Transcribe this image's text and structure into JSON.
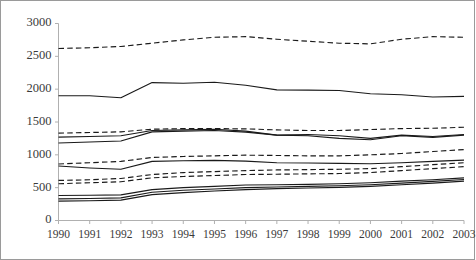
{
  "chart_data": {
    "type": "line",
    "title": "",
    "subtitle": "",
    "xlabel": "",
    "ylabel": "",
    "categories": [
      1990,
      1991,
      1992,
      1993,
      1994,
      1995,
      1996,
      1997,
      1998,
      1999,
      2000,
      2001,
      2002,
      2003
    ],
    "x": [
      "1990",
      "1991",
      "1992",
      "1993",
      "1994",
      "1995",
      "1996",
      "1997",
      "1998",
      "1999",
      "2000",
      "2001",
      "2002",
      "2003"
    ],
    "ylim": [
      0,
      3000
    ],
    "xlim": [
      1990,
      2003
    ],
    "yticks": [
      0,
      500,
      1000,
      1500,
      2000,
      2500,
      3000
    ],
    "ytick_labels": [
      "0",
      "500",
      "1000",
      "1500",
      "2000",
      "2500",
      "3000"
    ],
    "xtick_labels": [
      "1990",
      "1991",
      "1992",
      "1993",
      "1994",
      "1995",
      "1996",
      "1997",
      "1998",
      "1999",
      "2000",
      "2001",
      "2002",
      "2003"
    ],
    "grid": false,
    "legend": "none",
    "legend_visible": false,
    "line_color": "#1a1a1a",
    "series": [
      {
        "name": "series-1",
        "style": "dashed",
        "band": "top",
        "values": [
          2620,
          2630,
          2650,
          2700,
          2750,
          2790,
          2800,
          2760,
          2730,
          2700,
          2690,
          2760,
          2800,
          2790
        ]
      },
      {
        "name": "series-2",
        "style": "solid",
        "band": "upper-mid",
        "values": [
          1900,
          1900,
          1870,
          2100,
          2090,
          2105,
          2060,
          1990,
          1985,
          1980,
          1930,
          1915,
          1880,
          1890
        ]
      },
      {
        "name": "series-3",
        "style": "dashed",
        "band": "mid",
        "values": [
          1330,
          1340,
          1350,
          1390,
          1400,
          1400,
          1395,
          1380,
          1370,
          1370,
          1385,
          1400,
          1405,
          1420
        ]
      },
      {
        "name": "series-4",
        "style": "solid",
        "band": "mid",
        "values": [
          1270,
          1280,
          1290,
          1370,
          1380,
          1390,
          1360,
          1300,
          1310,
          1290,
          1250,
          1300,
          1280,
          1310
        ]
      },
      {
        "name": "series-5",
        "style": "solid",
        "band": "mid",
        "values": [
          1180,
          1195,
          1210,
          1350,
          1360,
          1370,
          1345,
          1300,
          1290,
          1250,
          1230,
          1290,
          1265,
          1300
        ]
      },
      {
        "name": "series-6",
        "style": "dashed",
        "band": "lower-mid",
        "values": [
          860,
          880,
          900,
          960,
          975,
          985,
          995,
          990,
          985,
          985,
          1000,
          1020,
          1050,
          1080
        ]
      },
      {
        "name": "series-7",
        "style": "solid",
        "band": "lower-mid",
        "values": [
          830,
          800,
          780,
          900,
          910,
          915,
          905,
          880,
          875,
          870,
          865,
          880,
          900,
          920
        ]
      },
      {
        "name": "series-8",
        "style": "dashed",
        "band": "lower-mid",
        "values": [
          610,
          620,
          640,
          700,
          730,
          745,
          760,
          770,
          775,
          780,
          790,
          820,
          850,
          880
        ]
      },
      {
        "name": "series-9",
        "style": "dashed",
        "band": "lower-mid",
        "values": [
          560,
          575,
          590,
          650,
          670,
          685,
          700,
          705,
          710,
          715,
          730,
          760,
          790,
          820
        ]
      },
      {
        "name": "series-10",
        "style": "solid",
        "band": "bottom",
        "values": [
          380,
          385,
          390,
          470,
          500,
          520,
          540,
          545,
          550,
          560,
          575,
          600,
          620,
          650
        ]
      },
      {
        "name": "series-11",
        "style": "solid",
        "band": "bottom",
        "values": [
          330,
          335,
          345,
          430,
          460,
          480,
          500,
          510,
          520,
          530,
          545,
          570,
          595,
          625
        ]
      },
      {
        "name": "series-12",
        "style": "solid",
        "band": "bottom",
        "values": [
          295,
          300,
          310,
          395,
          425,
          450,
          470,
          485,
          495,
          505,
          520,
          545,
          570,
          600
        ]
      }
    ]
  }
}
